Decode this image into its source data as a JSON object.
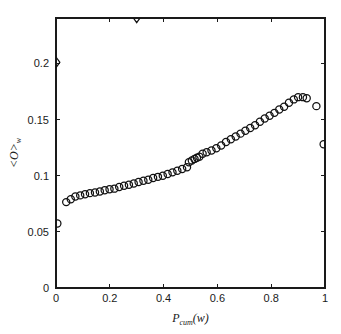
{
  "chart_data": {
    "type": "scatter",
    "title": "",
    "xlabel": "P_cum(w)",
    "ylabel": "<O>_w",
    "xlabel_parts": {
      "base": "P",
      "sub": "cum",
      "tail": "(w)"
    },
    "ylabel_parts": {
      "base": "<O>",
      "sub": "w"
    },
    "xlim": [
      0,
      1
    ],
    "ylim": [
      0,
      0.2405
    ],
    "xticks": [
      0,
      0.2,
      0.4,
      0.6,
      0.8,
      1
    ],
    "xticklabels": [
      "0",
      "0.2",
      "0.4",
      "0.6",
      "0.8",
      "1"
    ],
    "yticks": [
      0,
      0.05,
      0.1,
      0.15,
      0.2
    ],
    "yticklabels": [
      "0",
      "0.05",
      "0.1",
      "0.15",
      "0.2"
    ],
    "grid": false,
    "legend": null,
    "marker_color": "#111111",
    "axis_color": "#1a1a1a",
    "background": "#ffffff",
    "series": [
      {
        "name": "mean overlap",
        "marker": "circle",
        "x": [
          0.005,
          0.038,
          0.055,
          0.072,
          0.09,
          0.108,
          0.126,
          0.145,
          0.163,
          0.181,
          0.199,
          0.217,
          0.235,
          0.253,
          0.271,
          0.289,
          0.307,
          0.325,
          0.343,
          0.361,
          0.379,
          0.397,
          0.415,
          0.433,
          0.451,
          0.469,
          0.487,
          0.494,
          0.505,
          0.515,
          0.524,
          0.533,
          0.545,
          0.56,
          0.578,
          0.596,
          0.614,
          0.632,
          0.65,
          0.668,
          0.686,
          0.704,
          0.722,
          0.74,
          0.758,
          0.776,
          0.794,
          0.812,
          0.83,
          0.848,
          0.866,
          0.884,
          0.9,
          0.918,
          0.932,
          0.968,
          0.995
        ],
        "y": [
          0.0575,
          0.0765,
          0.079,
          0.0815,
          0.0825,
          0.0835,
          0.0845,
          0.085,
          0.086,
          0.087,
          0.088,
          0.0885,
          0.09,
          0.091,
          0.092,
          0.093,
          0.0945,
          0.0955,
          0.0965,
          0.098,
          0.099,
          0.1,
          0.1015,
          0.103,
          0.1045,
          0.106,
          0.1075,
          0.112,
          0.1135,
          0.115,
          0.116,
          0.117,
          0.1195,
          0.121,
          0.1225,
          0.1245,
          0.127,
          0.13,
          0.1325,
          0.135,
          0.1375,
          0.14,
          0.1425,
          0.145,
          0.148,
          0.151,
          0.1535,
          0.156,
          0.159,
          0.1615,
          0.165,
          0.168,
          0.17,
          0.17,
          0.169,
          0.162,
          0.128
        ]
      },
      {
        "name": "outlier markers",
        "marker": "diamond",
        "x": [
          0.002,
          0.3
        ],
        "y": [
          0.201,
          0.2405
        ],
        "clipped": [
          false,
          true
        ]
      }
    ]
  },
  "plot_box": {
    "left": 56,
    "right": 325,
    "top": 18,
    "bottom": 288
  }
}
